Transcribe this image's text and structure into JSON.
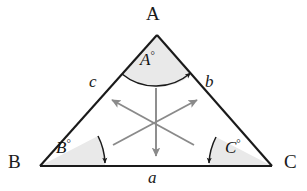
{
  "figure": {
    "name": "labeled-triangle-with-interior-arrows",
    "type": "geometry-diagram",
    "background_color": "#ffffff",
    "stroke_color": "#1a1a1a",
    "sector_fill_color": "#e9e9e9",
    "arrow_color": "#8a8a8a",
    "vertices": [
      {
        "id": "A",
        "label": "A",
        "x": 157,
        "y": 35
      },
      {
        "id": "B",
        "label": "B",
        "x": 40,
        "y": 166
      },
      {
        "id": "C",
        "label": "C",
        "x": 272,
        "y": 166
      }
    ],
    "sides": [
      {
        "id": "a",
        "label": "a",
        "between": "B-C",
        "position": "below-base"
      },
      {
        "id": "b",
        "label": "b",
        "between": "A-C",
        "position": "right-outside"
      },
      {
        "id": "c",
        "label": "c",
        "between": "A-B",
        "position": "left-outside"
      }
    ],
    "angles": [
      {
        "id": "A",
        "letter": "A",
        "degree_symbol": "°",
        "at_vertex": "A"
      },
      {
        "id": "B",
        "letter": "B",
        "degree_symbol": "°",
        "at_vertex": "B"
      },
      {
        "id": "C",
        "letter": "C",
        "degree_symbol": "°",
        "at_vertex": "C"
      }
    ],
    "interior_arrows": [
      {
        "id": "up-left",
        "from": "center",
        "to": "toward-side-c"
      },
      {
        "id": "up-right",
        "from": "center",
        "to": "toward-side-b"
      },
      {
        "id": "down",
        "from": "center",
        "to": "toward-side-a"
      }
    ]
  }
}
